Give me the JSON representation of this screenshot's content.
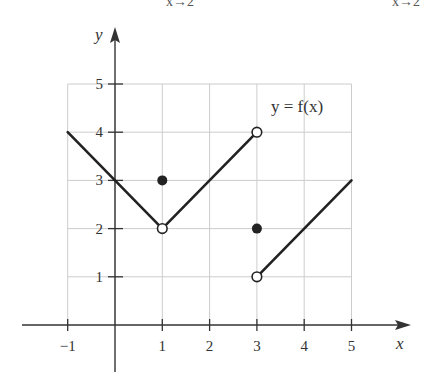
{
  "clipped_header": {
    "left_fragment": "x→2",
    "right_fragment": "x→2"
  },
  "chart_data": {
    "type": "line",
    "title": "",
    "curve_label": "y = f(x)",
    "xlabel": "x",
    "ylabel": "y",
    "xlim": [
      -1,
      5
    ],
    "ylim": [
      0,
      5
    ],
    "x_ticks": [
      -1,
      1,
      2,
      3,
      4,
      5
    ],
    "x_tick_labels": [
      "−1",
      "1",
      "2",
      "3",
      "4",
      "5"
    ],
    "y_ticks": [
      1,
      2,
      3,
      4,
      5
    ],
    "y_tick_labels": [
      "1",
      "2",
      "3",
      "4",
      "5"
    ],
    "grid": true,
    "legend": "none",
    "segments": [
      {
        "from": [
          -1,
          4
        ],
        "to": [
          1,
          2
        ]
      },
      {
        "from": [
          1,
          2
        ],
        "to": [
          3,
          4
        ]
      },
      {
        "from": [
          3,
          1
        ],
        "to": [
          5,
          3
        ]
      }
    ],
    "open_points": [
      [
        1,
        2
      ],
      [
        3,
        4
      ],
      [
        3,
        1
      ]
    ],
    "closed_points": [
      [
        1,
        3
      ],
      [
        3,
        2
      ]
    ]
  },
  "colors": {
    "curve": "#222222",
    "axis": "#333333",
    "grid": "#cccccc",
    "text": "#333333"
  }
}
